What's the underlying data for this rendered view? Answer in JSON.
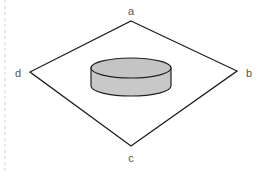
{
  "diagram": {
    "vertices": [
      {
        "id": "a",
        "label": "a",
        "x": 131,
        "y": 21,
        "label_x": 131,
        "label_y": 11
      },
      {
        "id": "b",
        "label": "b",
        "x": 237,
        "y": 71,
        "label_x": 249,
        "label_y": 73
      },
      {
        "id": "c",
        "label": "c",
        "x": 131,
        "y": 146,
        "label_x": 131,
        "label_y": 158
      },
      {
        "id": "d",
        "label": "d",
        "x": 30,
        "y": 72,
        "label_x": 18,
        "label_y": 73
      }
    ],
    "cylinder": {
      "cx": 131,
      "top_cy": 68,
      "bottom_cy": 86,
      "rx": 40,
      "ry": 10,
      "fill": "#c8c8c8",
      "top_fill": "#c4c4c4",
      "stroke": "#222222"
    },
    "colors": {
      "plane_stroke": "#1e1e1e",
      "label_color": "#555555",
      "guide_line": "#cccccc",
      "background": "#ffffff"
    }
  }
}
